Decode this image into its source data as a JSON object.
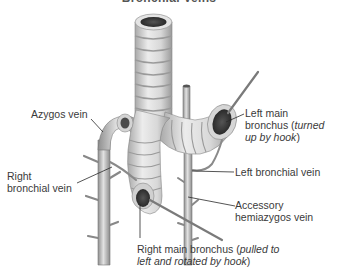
{
  "figure": {
    "title": "Bronchial Veins",
    "labels": {
      "azygos_vein": "Azygos vein",
      "right_bronchial_vein_line1": "Right",
      "right_bronchial_vein_line2": "bronchial vein",
      "left_main_bronchus_line1": "Left main",
      "left_main_bronchus_line2_plain": "bronchus (",
      "left_main_bronchus_line2_italic": "turned",
      "left_main_bronchus_line3_italic": "up by hook",
      "left_main_bronchus_line3_close": ")",
      "left_bronchial_vein": "Left bronchial vein",
      "accessory_hemiazygos_line1": "Accessory",
      "accessory_hemiazygos_line2": "hemiazygos vein",
      "right_main_bronchus_line1_plain": "Right main bronchus (",
      "right_main_bronchus_line1_italic": "pulled to",
      "right_main_bronchus_line2_italic": "left and rotated by hook",
      "right_main_bronchus_line2_close": ")"
    },
    "colors": {
      "background": "#ffffff",
      "text": "#3a3a3a",
      "leader_line": "#2a2a2a",
      "tissue_light": "#e6e6e6",
      "tissue_mid": "#bdbdbd",
      "tissue_dark": "#6e6e6e",
      "lumen": "#2e2e2e"
    }
  }
}
